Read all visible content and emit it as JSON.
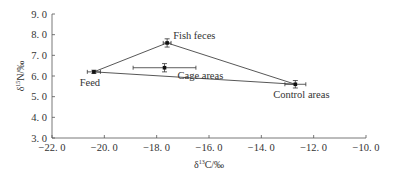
{
  "chart_data": {
    "type": "scatter",
    "title": "",
    "xlabel": "δ13C/‰",
    "ylabel": "δ15N/‰",
    "xlim": [
      -22.0,
      -10.0
    ],
    "ylim": [
      3.0,
      9.0
    ],
    "x_ticks": [
      "-22.0",
      "-20.0",
      "-18.0",
      "-16.0",
      "-14.0",
      "-12.0",
      "-10.0"
    ],
    "y_ticks": [
      "3.0",
      "4.0",
      "5.0",
      "6.0",
      "7.0",
      "8.0",
      "9.0"
    ],
    "grid": false,
    "legend": "none",
    "points": [
      {
        "label": "Feed",
        "x": -20.4,
        "y": 6.2,
        "xerr": 0.25,
        "yerr": 0.08
      },
      {
        "label": "Fish feces",
        "x": -17.6,
        "y": 7.6,
        "xerr": 0.15,
        "yerr": 0.2
      },
      {
        "label": "Cage areas",
        "x": -17.7,
        "y": 6.4,
        "xerr": 1.2,
        "yerr": 0.2
      },
      {
        "label": "Control areas",
        "x": -12.7,
        "y": 5.6,
        "xerr": 0.4,
        "yerr": 0.18
      }
    ],
    "triangle": [
      "Feed",
      "Fish feces",
      "Control areas"
    ]
  }
}
